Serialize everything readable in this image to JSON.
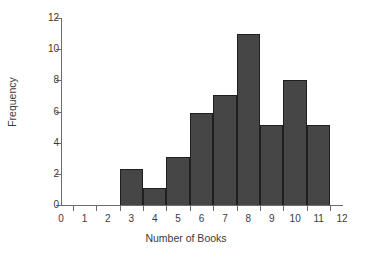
{
  "chart_data": {
    "type": "bar",
    "title": "",
    "subtitle": "",
    "xlabel": "Number of Books",
    "ylabel": "Frequency",
    "categories": [
      3,
      4,
      5,
      6,
      7,
      8,
      9,
      10,
      11
    ],
    "values": [
      2.3,
      1.1,
      3.1,
      5.9,
      7.05,
      11.0,
      5.15,
      8.0,
      5.15
    ],
    "series": [
      {
        "name": "Frequency",
        "values": [
          2.3,
          1.1,
          3.1,
          5.9,
          7.05,
          11.0,
          5.15,
          8.0,
          5.15
        ]
      }
    ],
    "bar_edges": [
      2.5,
      3.5,
      4.5,
      5.5,
      6.5,
      7.5,
      8.5,
      9.5,
      10.5,
      11.5
    ],
    "bin_width": 1,
    "xlim": [
      0,
      12
    ],
    "ylim": [
      0,
      12
    ],
    "x_ticks": [
      0,
      1,
      2,
      3,
      4,
      5,
      6,
      7,
      8,
      9,
      10,
      11,
      12
    ],
    "x_tick_labels": [
      "0",
      "1",
      "2",
      "3",
      "4",
      "5",
      "6",
      "7",
      "8",
      "9",
      "10",
      "11",
      "12"
    ],
    "y_ticks": [
      0,
      2,
      4,
      6,
      8,
      10,
      12
    ],
    "y_tick_labels": [
      "0",
      "2",
      "4",
      "6",
      "8",
      "10",
      "12"
    ],
    "grid": false,
    "legend": false,
    "legend_position": "none",
    "bar_color": "#464646",
    "bar_edge_color": "#1f1f1f",
    "axis_color": "#6b6b6b",
    "text_color": "#3b3b3b",
    "background_color": "#ffffff",
    "annotations": []
  }
}
